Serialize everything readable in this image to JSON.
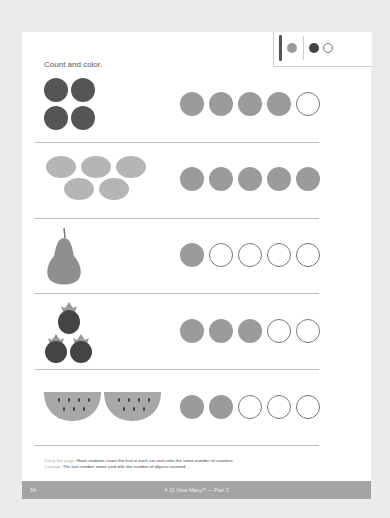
{
  "worksheet": {
    "instruction": "Count and color.",
    "legend": {
      "icons": [
        "crayon-icon",
        "gray-dot",
        "dark-dot",
        "empty-dot"
      ],
      "colors": {
        "crayon": "#555555",
        "gray": "#9b9b9b",
        "dark": "#444444",
        "empty": "#ffffff"
      }
    },
    "rows": [
      {
        "fruit": "plums",
        "count": 4,
        "filled": 4,
        "total": 5
      },
      {
        "fruit": "lemons",
        "count": 5,
        "filled": 5,
        "total": 5
      },
      {
        "fruit": "pear",
        "count": 1,
        "filled": 1,
        "total": 5
      },
      {
        "fruit": "strawberries",
        "count": 3,
        "filled": 3,
        "total": 5
      },
      {
        "fruit": "watermelon slices",
        "count": 2,
        "filled": 2,
        "total": 5
      }
    ],
    "notes": {
      "using_label": "Using this page:",
      "using_text": " Have students count the fruit in each set and color the same number of counters.",
      "concept_label": "Concept:",
      "concept_text": " The last number name said tells the number of objects counted."
    },
    "footer": {
      "page_number": "54",
      "lesson": "4-11  How Many? — Part 2"
    }
  }
}
